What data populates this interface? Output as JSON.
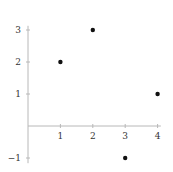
{
  "chart_data": {
    "type": "scatter",
    "title": "",
    "xlabel": "",
    "ylabel": "",
    "x": [
      1,
      2,
      3,
      4
    ],
    "y": [
      2,
      3,
      -1,
      1
    ],
    "points": [
      {
        "x": 1,
        "y": 2
      },
      {
        "x": 2,
        "y": 3
      },
      {
        "x": 3,
        "y": -1
      },
      {
        "x": 4,
        "y": 1
      }
    ],
    "xticks": [
      1,
      2,
      3,
      4
    ],
    "yticks": [
      3,
      2,
      1,
      -1
    ],
    "xtick_labels": [
      "1",
      "2",
      "3",
      "4"
    ],
    "ytick_labels": [
      "3",
      "2",
      "1",
      "−1"
    ],
    "xlim": [
      0,
      4.1
    ],
    "ylim": [
      -1.1,
      3.1
    ],
    "grid": false,
    "legend": null,
    "colors": {
      "point": "#111111",
      "axis": "#b8b8b8",
      "label": "#333333"
    }
  }
}
